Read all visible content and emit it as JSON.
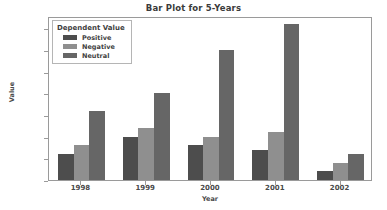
{
  "chart_data": {
    "type": "bar",
    "title": "Bar Plot for 5-Years",
    "xlabel": "Year",
    "ylabel": "Value",
    "categories": [
      "1998",
      "1999",
      "2000",
      "2001",
      "2002"
    ],
    "series": [
      {
        "name": "Positive",
        "values": [
          3.0,
          5.0,
          4.0,
          3.5,
          1.0
        ],
        "color": "#4d4d4d"
      },
      {
        "name": "Negative",
        "values": [
          4.0,
          6.0,
          5.0,
          5.5,
          2.0
        ],
        "color": "#8f8f8f"
      },
      {
        "name": "Neutral",
        "values": [
          8.0,
          10.0,
          15.0,
          18.0,
          3.0
        ],
        "color": "#666666"
      }
    ],
    "legend_title": "Dependent Value",
    "legend_position": "upper left",
    "ylim": [
      0,
      18.9
    ],
    "yticks": [
      "0.0",
      "2.5",
      "5.0",
      "7.5",
      "10.0",
      "12.5",
      "15.0",
      "17.5"
    ],
    "ytick_values": [
      0.0,
      2.5,
      5.0,
      7.5,
      10.0,
      12.5,
      15.0,
      17.5
    ],
    "grid": false
  }
}
